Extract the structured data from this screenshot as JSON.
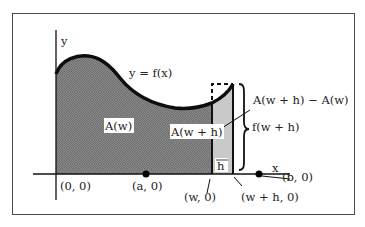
{
  "diagram": {
    "axes": {
      "x_label": "x",
      "y_label": "y"
    },
    "curve_label": "y = f(x)",
    "region_labels": {
      "area_w": "A(w)",
      "area_w_plus_h": "A(w + h)",
      "difference": "A(w + h) − A(w)",
      "height": "f(w + h)",
      "width": "h"
    },
    "points": {
      "origin": "(0, 0)",
      "a": "(a, 0)",
      "w": "(w, 0)",
      "w_plus_h": "(w + h, 0)",
      "b": "(b, 0)"
    },
    "colors": {
      "frame": "#4a4a4a",
      "curve": "#111111",
      "shaded_area": "#8a8a8a",
      "strip": "#c8c8c8"
    }
  }
}
